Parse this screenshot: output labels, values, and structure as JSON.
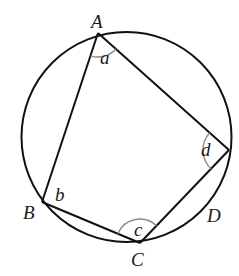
{
  "diagram": {
    "colors": {
      "stroke": "#111111",
      "angle_arc": "#8a8a8a",
      "background": "#ffffff"
    },
    "circle": {
      "cx": 126.5,
      "cy": 137,
      "r": 105
    },
    "vertices": {
      "A": {
        "x": 98,
        "y": 33,
        "label": "A"
      },
      "B": {
        "x": 42,
        "y": 202,
        "label": "B"
      },
      "C": {
        "x": 140,
        "y": 243,
        "label": "C"
      },
      "D": {
        "x": 229,
        "y": 150,
        "label": "D"
      }
    },
    "angles": {
      "a": {
        "label": "a"
      },
      "b": {
        "label": "b"
      },
      "c": {
        "label": "c"
      },
      "d": {
        "label": "d"
      }
    }
  }
}
